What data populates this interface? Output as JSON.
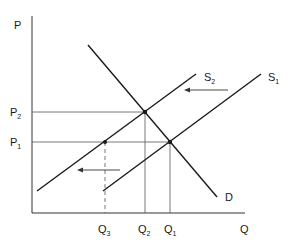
{
  "diagram": {
    "axes": {
      "y_label": "P",
      "x_label": "Q"
    },
    "price_levels": [
      {
        "label": "P",
        "sub": "2"
      },
      {
        "label": "P",
        "sub": "1"
      }
    ],
    "quantity_levels": [
      {
        "label": "Q",
        "sub": "3"
      },
      {
        "label": "Q",
        "sub": "2"
      },
      {
        "label": "Q",
        "sub": "1"
      }
    ],
    "curves": {
      "demand": {
        "label": "D"
      },
      "supply_original": {
        "label": "S",
        "sub": "1"
      },
      "supply_new": {
        "label": "S",
        "sub": "2"
      }
    },
    "arrows": [
      {
        "direction": "left",
        "meaning": "supply shift from S1 to S2 (upper)"
      },
      {
        "direction": "left",
        "meaning": "supply shift from S1 to S2 (lower)"
      }
    ],
    "colors": {
      "line": "#1a1a1a",
      "guide": "#555555",
      "background": "#ffffff"
    }
  }
}
